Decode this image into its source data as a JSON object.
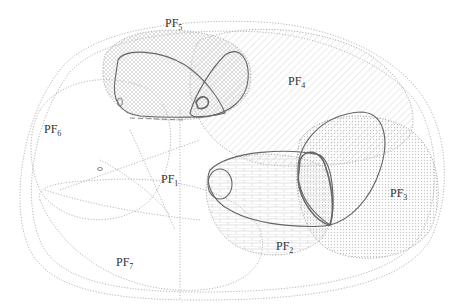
{
  "diagram": {
    "type": "region-overlap diagram",
    "regions": [
      {
        "id": "pf1",
        "label": "PF",
        "sub": "1",
        "x": 161,
        "y": 172,
        "fill": "none"
      },
      {
        "id": "pf2",
        "label": "PF",
        "sub": "2",
        "x": 276,
        "y": 239,
        "fill": "horizontal-brick-hatch"
      },
      {
        "id": "pf3",
        "label": "PF",
        "sub": "3",
        "x": 390,
        "y": 186,
        "fill": "dense-dot"
      },
      {
        "id": "pf4",
        "label": "PF",
        "sub": "4",
        "x": 288,
        "y": 74,
        "fill": "diagonal-hatch"
      },
      {
        "id": "pf5",
        "label": "PF",
        "sub": "5",
        "x": 165,
        "y": 16,
        "fill": "cross-hatch"
      },
      {
        "id": "pf6",
        "label": "PF",
        "sub": "6",
        "x": 44,
        "y": 122,
        "fill": "none"
      },
      {
        "id": "pf7",
        "label": "PF",
        "sub": "7",
        "x": 116,
        "y": 255,
        "fill": "none"
      }
    ],
    "colors": {
      "stroke_solid": "#666666",
      "stroke_dotted": "#aaaaaa",
      "label": "#333333",
      "hatch": "#cccccc"
    }
  }
}
